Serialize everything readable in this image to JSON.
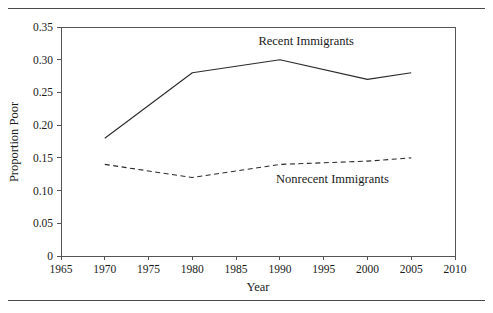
{
  "chart_data": {
    "type": "line",
    "title": "",
    "xlabel": "Year",
    "ylabel": "Proportion Poor",
    "xlim": [
      1965,
      2010
    ],
    "ylim": [
      0,
      0.35
    ],
    "grid": false,
    "legend_position": "inline-annotation",
    "x": [
      1970,
      1980,
      1990,
      2000,
      2005
    ],
    "xticks": [
      "1965",
      "1970",
      "1975",
      "1980",
      "1985",
      "1990",
      "1995",
      "2000",
      "2005",
      "2010"
    ],
    "xtick_values": [
      1965,
      1970,
      1975,
      1980,
      1985,
      1990,
      1995,
      2000,
      2005,
      2010
    ],
    "yticks": [
      "0",
      "0.05",
      "0.10",
      "0.15",
      "0.20",
      "0.25",
      "0.30",
      "0.35"
    ],
    "ytick_values": [
      0,
      0.05,
      0.1,
      0.15,
      0.2,
      0.25,
      0.3,
      0.35
    ],
    "series": [
      {
        "name": "Recent Immigrants",
        "style": "solid",
        "color": "#2a2a2a",
        "x": [
          1970,
          1980,
          1990,
          2000,
          2005
        ],
        "values": [
          0.18,
          0.28,
          0.3,
          0.27,
          0.28
        ],
        "label_x": 1993,
        "label_y": 0.322
      },
      {
        "name": "Nonrecent Immigrants",
        "style": "dashed",
        "color": "#2a2a2a",
        "x": [
          1970,
          1980,
          1990,
          2000,
          2005
        ],
        "values": [
          0.14,
          0.12,
          0.14,
          0.145,
          0.15
        ],
        "label_x": 1996,
        "label_y": 0.112
      }
    ]
  },
  "figure": {
    "axis_color": "#555555",
    "rule_color": "#4a4a4a",
    "background": "#ffffff"
  }
}
